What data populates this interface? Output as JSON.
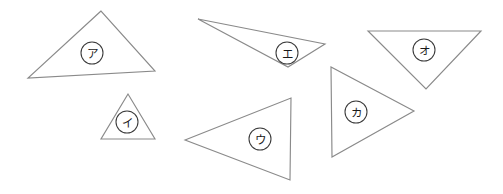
{
  "figure": {
    "background_color": "#ffffff",
    "outline_color": "#8a8a8a",
    "label_circle_color": "#3a3a3a",
    "label_text_color": "#1a1a1a",
    "width": 503,
    "height": 194
  },
  "shapes": [
    {
      "id": "triangle-a",
      "label": "ア",
      "points": "101,11 28,78 155,71",
      "label_x": 92,
      "label_y": 53,
      "label_r": 11
    },
    {
      "id": "triangle-i",
      "label": "イ",
      "points": "128,94 101,139 155,139",
      "label_x": 127,
      "label_y": 122,
      "label_r": 11
    },
    {
      "id": "triangle-u",
      "label": "ウ",
      "points": "185,140 291,98 290,180",
      "label_x": 260,
      "label_y": 139,
      "label_r": 11
    },
    {
      "id": "triangle-e",
      "label": "エ",
      "points": "198,19 325,44 288,67",
      "label_x": 287,
      "label_y": 53,
      "label_r": 11
    },
    {
      "id": "triangle-o",
      "label": "オ",
      "points": "368,31 481,31 426,89",
      "label_x": 424,
      "label_y": 50,
      "label_r": 11
    },
    {
      "id": "triangle-ka",
      "label": "カ",
      "points": "331,67 332,157 414,111",
      "label_x": 356,
      "label_y": 112,
      "label_r": 11
    }
  ]
}
